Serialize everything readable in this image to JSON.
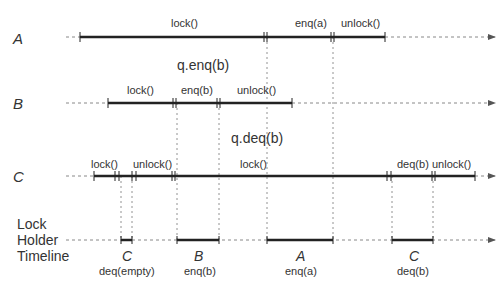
{
  "rows": {
    "A": {
      "label": "A",
      "ops": {
        "lock": "lock()",
        "enq": "enq(a)",
        "unlock": "unlock()"
      }
    },
    "B": {
      "label": "B",
      "ops": {
        "lock": "lock()",
        "enq": "enq(b)",
        "unlock": "unlock()"
      }
    },
    "C": {
      "label": "C",
      "ops": {
        "lock1": "lock()",
        "unlock1": "unlock()",
        "lock2": "lock()",
        "deq": "deq(b)",
        "unlock2": "unlock()"
      }
    }
  },
  "annotations": {
    "q_enq": "q.enq(b)",
    "q_deq": "q.deq(b)"
  },
  "lock_holder": {
    "title_lines": [
      "Lock",
      "Holder",
      "Timeline"
    ],
    "segments": [
      {
        "thread": "C",
        "op": "deq(empty)"
      },
      {
        "thread": "B",
        "op": "enq(b)"
      },
      {
        "thread": "A",
        "op": "enq(a)"
      },
      {
        "thread": "C",
        "op": "deq(b)"
      }
    ]
  },
  "colors": {
    "line": "#222222",
    "dashed": "#666666",
    "text": "#333333"
  }
}
